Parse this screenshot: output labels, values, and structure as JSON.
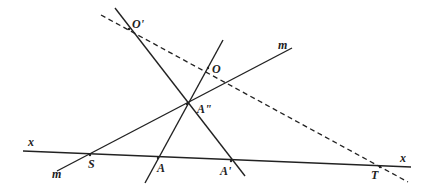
{
  "diagram": {
    "type": "geometric-construction",
    "lines": [
      {
        "id": "x",
        "label": "x",
        "style": "solid",
        "from": [
          23,
          151
        ],
        "to": [
          411,
          167
        ],
        "label_positions": [
          [
            28,
            146
          ],
          [
            400,
            162
          ]
        ]
      },
      {
        "id": "m",
        "label": "m",
        "style": "solid",
        "from": [
          57,
          171
        ],
        "to": [
          292,
          48
        ],
        "label_positions": [
          [
            52,
            178
          ],
          [
            278,
            49
          ]
        ]
      },
      {
        "id": "OprimeAprime",
        "style": "solid",
        "from": [
          115,
          8
        ],
        "to": [
          245,
          176
        ]
      },
      {
        "id": "OA",
        "style": "solid",
        "from": [
          223,
          40
        ],
        "to": [
          145,
          183
        ]
      },
      {
        "id": "OprimeOT",
        "style": "dashed",
        "from": [
          101,
          15
        ],
        "to": [
          408,
          182
        ]
      }
    ],
    "points": [
      {
        "id": "O_prime",
        "label": "O'",
        "pos": [
          129,
          29
        ],
        "label_pos": [
          132,
          28
        ]
      },
      {
        "id": "O",
        "label": "O",
        "pos": [
          208,
          68
        ],
        "label_pos": [
          212,
          73
        ]
      },
      {
        "id": "A_double_prime",
        "label": "A\"",
        "pos": [
          187,
          104
        ],
        "label_pos": [
          197,
          113
        ]
      },
      {
        "id": "S",
        "label": "S",
        "pos": [
          90,
          155
        ],
        "label_pos": [
          88,
          168
        ]
      },
      {
        "id": "A",
        "label": "A",
        "pos": [
          158,
          158
        ],
        "label_pos": [
          157,
          172
        ]
      },
      {
        "id": "A_prime",
        "label": "A'",
        "pos": [
          231,
          161
        ],
        "label_pos": [
          220,
          175
        ]
      },
      {
        "id": "T",
        "label": "T",
        "pos": [
          380,
          167
        ],
        "label_pos": [
          371,
          179
        ]
      }
    ],
    "line_labels": {
      "x_left": "x",
      "x_right": "x",
      "m_left": "m",
      "m_right": "m"
    },
    "colors": {
      "ink": "#222222",
      "background": "#ffffff"
    }
  }
}
